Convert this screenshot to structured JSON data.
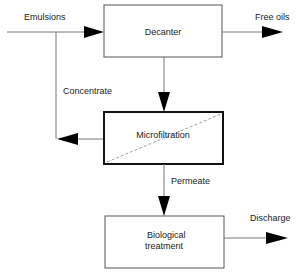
{
  "diagram": {
    "nodes": {
      "decanter": {
        "label": "Decanter"
      },
      "microfiltration": {
        "label": "Microfiltration"
      },
      "biological": {
        "label_line1": "Biological",
        "label_line2": "treatment"
      }
    },
    "flows": {
      "emulsions": "Emulsions",
      "free_oils": "Free oils",
      "concentrate": "Concentrate",
      "permeate": "Permeate",
      "discharge": "Discharge"
    }
  }
}
